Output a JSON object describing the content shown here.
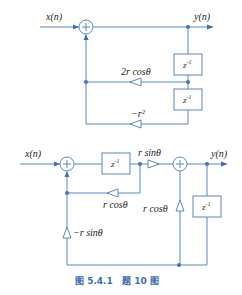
{
  "colors": {
    "wire": "#5b86c4",
    "node": "#3f6fb5",
    "caption": "#3a6fb5"
  },
  "top_diagram": {
    "input_label": "x(n)",
    "output_label": "y(n)",
    "delay_1": {
      "base": "z",
      "exp": "-1"
    },
    "delay_2": {
      "base": "z",
      "exp": "-1"
    },
    "gain_1": "2r cosθ",
    "gain_2": "−r²"
  },
  "bottom_diagram": {
    "input_label": "x(n)",
    "output_label": "y(n)",
    "delay_1": {
      "base": "z",
      "exp": "-1"
    },
    "delay_2": {
      "base": "z",
      "exp": "-1"
    },
    "gain_forward": "r sinθ",
    "gain_feedback": "r cosθ",
    "gain_cross": "r cosθ",
    "gain_neg": "−r sinθ"
  },
  "caption": "图 5.4.1   题 10 图"
}
